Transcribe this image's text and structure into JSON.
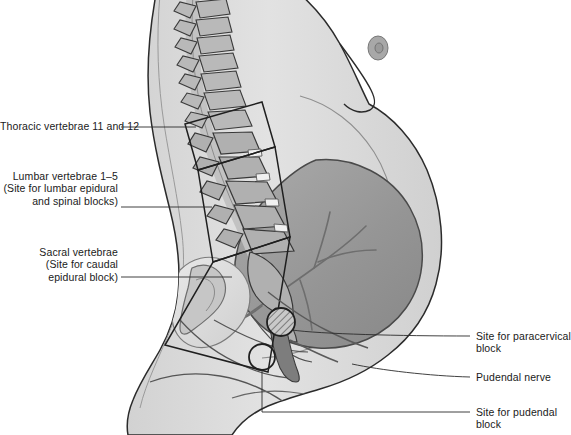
{
  "figure": {
    "kind": "medical-illustration",
    "view": "lateral sagittal view of pregnant woman",
    "background_color": "#ffffff",
    "body_fill_color": "#dcdcdc",
    "uterus_fill_color": "#9a9a9a",
    "bone_fill_color": "#b5b5b5",
    "outline_color": "#2b2b2b",
    "label_text_color": "#1a1a1a"
  },
  "labels_left": [
    {
      "id": "thoracic",
      "lines": [
        "Thoracic vertebrae 11 and 12"
      ],
      "text": "Thoracic vertebrae 11 and 12"
    },
    {
      "id": "lumbar",
      "lines": [
        "Lumbar vertebrae 1–5",
        "(Site for lumbar epidural",
        "and spinal blocks)"
      ],
      "text": "Lumbar vertebrae 1–5\n(Site for lumbar epidural\nand spinal blocks)"
    },
    {
      "id": "sacral",
      "lines": [
        "Sacral vertebrae",
        "(Site for caudal",
        "epidural block)"
      ],
      "text": "Sacral vertebrae\n(Site for caudal\nepidural block)"
    }
  ],
  "labels_right": [
    {
      "id": "paracervical",
      "lines": [
        "Site for paracervical",
        "block"
      ],
      "text": "Site for paracervical\nblock"
    },
    {
      "id": "pudendal-nerve",
      "lines": [
        "Pudendal nerve"
      ],
      "text": "Pudendal nerve"
    },
    {
      "id": "pudendal-block",
      "lines": [
        "Site for pudendal",
        "block"
      ],
      "text": "Site for pudendal\nblock"
    }
  ],
  "markers": {
    "paracervical_site": "hatched-circle",
    "pudendal_site": "open-circle"
  },
  "regions": [
    {
      "id": "thoracic-box",
      "shape": "rotated-rectangle"
    },
    {
      "id": "lumbar-box",
      "shape": "rotated-rectangle"
    },
    {
      "id": "sacral-box",
      "shape": "rotated-rectangle"
    }
  ]
}
